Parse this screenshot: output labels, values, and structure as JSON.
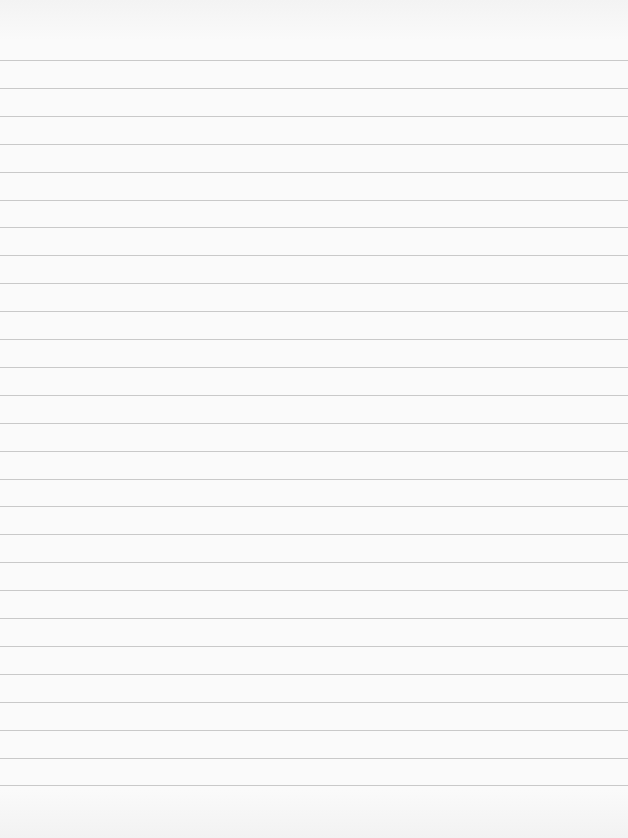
{
  "page": {
    "type": "blank-lined-paper",
    "background_color": "#f8f8f8",
    "line_color": "#c9c9c9",
    "first_line_y": 60,
    "line_spacing": 27.9,
    "line_count": 27
  }
}
